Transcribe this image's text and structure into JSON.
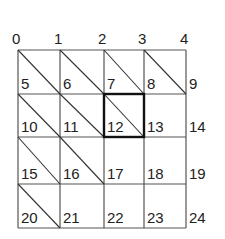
{
  "diagram": {
    "type": "lattice-grid",
    "columns": 4,
    "rows": 4,
    "grid_color": "#555555",
    "highlight_color": "#111111",
    "node_labels": [
      [
        "0",
        "1",
        "2",
        "3",
        "4"
      ],
      [
        "5",
        "6",
        "7",
        "8",
        "9"
      ],
      [
        "10",
        "11",
        "12",
        "13",
        "14"
      ],
      [
        "15",
        "16",
        "17",
        "18",
        "19"
      ],
      [
        "20",
        "21",
        "22",
        "23",
        "24"
      ]
    ],
    "diagonal_cells": [
      [
        0,
        0
      ],
      [
        0,
        1
      ],
      [
        0,
        2
      ],
      [
        0,
        3
      ],
      [
        1,
        0
      ],
      [
        1,
        1
      ],
      [
        1,
        2
      ],
      [
        2,
        0
      ],
      [
        2,
        1
      ],
      [
        3,
        0
      ]
    ],
    "highlighted_cell": {
      "row": 1,
      "col": 2
    }
  }
}
